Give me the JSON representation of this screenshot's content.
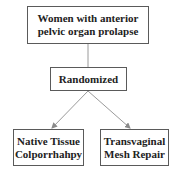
{
  "diagram": {
    "type": "flowchart",
    "nodes": {
      "population": {
        "label": "Women with anterior\npelvic organ prolapse"
      },
      "randomized": {
        "label": "Randomized"
      },
      "arm_left": {
        "label": "Native Tissue\nColporrhahpy"
      },
      "arm_right": {
        "label": "Transvaginal\nMesh Repair"
      }
    },
    "edges": [
      {
        "from": "population",
        "to": "randomized",
        "arrow": false
      },
      {
        "from": "randomized",
        "to": "arm_left",
        "arrow": true
      },
      {
        "from": "randomized",
        "to": "arm_right",
        "arrow": true
      }
    ],
    "colors": {
      "border": "#5a5a5a",
      "line": "#9a9a9a",
      "text": "#222222"
    }
  }
}
